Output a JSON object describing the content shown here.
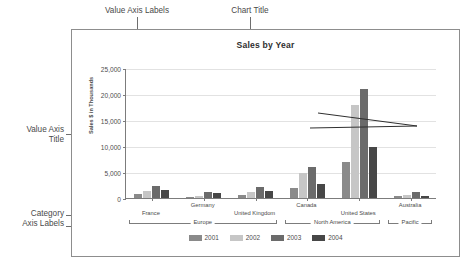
{
  "annotations": {
    "value_axis_labels": "Value Axis Labels",
    "chart_title": "Chart Title",
    "value_axis_title": "Value Axis\nTitle",
    "category_axis_labels": "Category\nAxis Labels",
    "series": "Series",
    "legend": "Legend"
  },
  "chart_data": {
    "type": "bar",
    "title": "Sales by Year",
    "xlabel": "",
    "ylabel": "Sales $ in Thousands",
    "ylim": [
      0,
      25000
    ],
    "yticks": [
      "0",
      "5,000",
      "10,000",
      "15,000",
      "20,000",
      "25,000"
    ],
    "ytick_values": [
      0,
      5000,
      10000,
      15000,
      20000,
      25000
    ],
    "grid": true,
    "legend_position": "bottom",
    "categories": [
      "France",
      "Germany",
      "United Kingdom",
      "Canada",
      "United States",
      "Australia"
    ],
    "category_groups": [
      {
        "label": "Europe",
        "members": [
          "France",
          "Germany",
          "United Kingdom"
        ]
      },
      {
        "label": "North America",
        "members": [
          "Canada",
          "United States"
        ]
      },
      {
        "label": "Pacific",
        "members": [
          "Australia"
        ]
      }
    ],
    "series": [
      {
        "name": "2001",
        "color": "#8a8a8a",
        "values": [
          700,
          200,
          600,
          1900,
          7000,
          300
        ]
      },
      {
        "name": "2002",
        "color": "#c6c6c6",
        "values": [
          1300,
          300,
          1200,
          4900,
          17800,
          500
        ]
      },
      {
        "name": "2003",
        "color": "#6b6b6b",
        "values": [
          2300,
          1200,
          2100,
          6000,
          20900,
          1200
        ]
      },
      {
        "name": "2004",
        "color": "#474747",
        "values": [
          1500,
          1000,
          1400,
          2600,
          9900,
          400
        ]
      }
    ]
  }
}
